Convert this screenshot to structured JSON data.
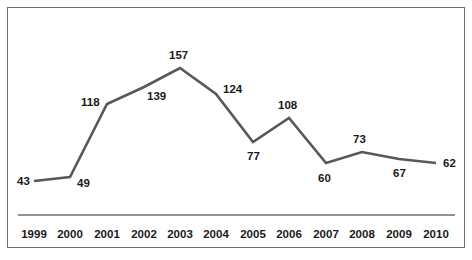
{
  "chart_data": {
    "type": "line",
    "title": "",
    "subtitle": "",
    "xlabel": "",
    "ylabel": "",
    "categories": [
      "1999",
      "2000",
      "2001",
      "2002",
      "2003",
      "2004",
      "2005",
      "2006",
      "2007",
      "2008",
      "2009",
      "2010"
    ],
    "values": [
      43,
      49,
      118,
      139,
      157,
      124,
      77,
      108,
      60,
      73,
      67,
      62
    ],
    "value_labels": [
      "43",
      "49",
      "118",
      "139",
      "157",
      "124",
      "77",
      "108",
      "60",
      "73",
      "67",
      "62"
    ],
    "series": [
      {
        "name": "",
        "values": [
          43,
          49,
          118,
          139,
          157,
          124,
          77,
          108,
          60,
          73,
          67,
          62
        ]
      }
    ],
    "ylim": [
      0,
      175
    ],
    "grid": false,
    "legend": "none",
    "data_labels_shown": true,
    "axis_shown": "x-only",
    "markers": false
  },
  "style": {
    "line_color": "#58585a",
    "axis_color": "#6e6e6e",
    "frame_color": "#6e6e6e",
    "text_color": "#1a1a1a",
    "background": "#ffffff"
  },
  "label_offsets": [
    {
      "dx": -17,
      "dy": 4
    },
    {
      "dx": 7,
      "dy": 10
    },
    {
      "dx": -26,
      "dy": 2
    },
    {
      "dx": 3,
      "dy": 13
    },
    {
      "dx": -11,
      "dy": -9
    },
    {
      "dx": 7,
      "dy": -1
    },
    {
      "dx": -6,
      "dy": 18
    },
    {
      "dx": -11,
      "dy": -9
    },
    {
      "dx": -8,
      "dy": 19
    },
    {
      "dx": -9,
      "dy": -9
    },
    {
      "dx": -6,
      "dy": 18
    },
    {
      "dx": 7,
      "dy": 4
    }
  ],
  "geometry": {
    "points_px": [
      {
        "x": 34,
        "y": 181
      },
      {
        "x": 70,
        "y": 177
      },
      {
        "x": 107,
        "y": 104
      },
      {
        "x": 144,
        "y": 87
      },
      {
        "x": 180,
        "y": 68
      },
      {
        "x": 216,
        "y": 94
      },
      {
        "x": 253,
        "y": 142
      },
      {
        "x": 289,
        "y": 118
      },
      {
        "x": 326,
        "y": 163
      },
      {
        "x": 362,
        "y": 152
      },
      {
        "x": 399,
        "y": 159
      },
      {
        "x": 436,
        "y": 163
      }
    ],
    "axis_y_px": 215,
    "axis_x_start_px": 18,
    "axis_x_end_px": 455,
    "tick_label_y_px": 238
  }
}
